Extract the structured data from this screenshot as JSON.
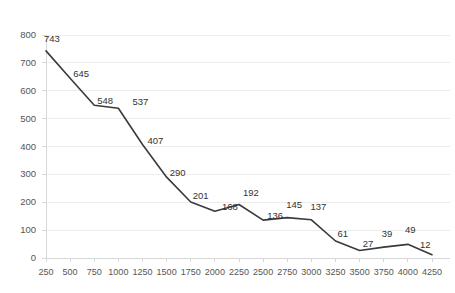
{
  "chart_data": {
    "type": "line",
    "title": "",
    "xlabel": "",
    "ylabel": "",
    "x": [
      250,
      500,
      750,
      1000,
      1250,
      1500,
      1750,
      2000,
      2250,
      2500,
      2750,
      3000,
      3250,
      3500,
      3750,
      4000,
      4250
    ],
    "values": [
      743,
      645,
      548,
      537,
      407,
      290,
      201,
      168,
      192,
      136,
      145,
      137,
      61,
      27,
      39,
      49,
      12
    ],
    "categories": [
      "250",
      "500",
      "750",
      "1000",
      "1250",
      "1500",
      "1750",
      "2000",
      "2250",
      "2500",
      "2750",
      "3000",
      "3250",
      "3500",
      "3750",
      "4000",
      "4250"
    ],
    "point_labels": [
      "743",
      "645",
      "548",
      "537",
      "407",
      "290",
      "201",
      "168",
      "192",
      "136",
      "145",
      "137",
      "61",
      "27",
      "39",
      "49",
      "12"
    ],
    "y_ticks": [
      0,
      100,
      200,
      300,
      400,
      500,
      600,
      700,
      800
    ],
    "y_tick_labels": [
      "0",
      "100",
      "200",
      "300",
      "400",
      "500",
      "600",
      "700",
      "800"
    ],
    "ylim": [
      0,
      800
    ],
    "xlim": [
      250,
      4250
    ],
    "grid": true,
    "legend": false,
    "legend_position": "none",
    "series_color": "#3a3a3a",
    "grid_color": "#ededed",
    "axis_color": "#d8d8d8",
    "label_color": "#333333",
    "tick_color": "#555555",
    "background": "#ffffff",
    "line_width": 1.6,
    "markers": false
  }
}
